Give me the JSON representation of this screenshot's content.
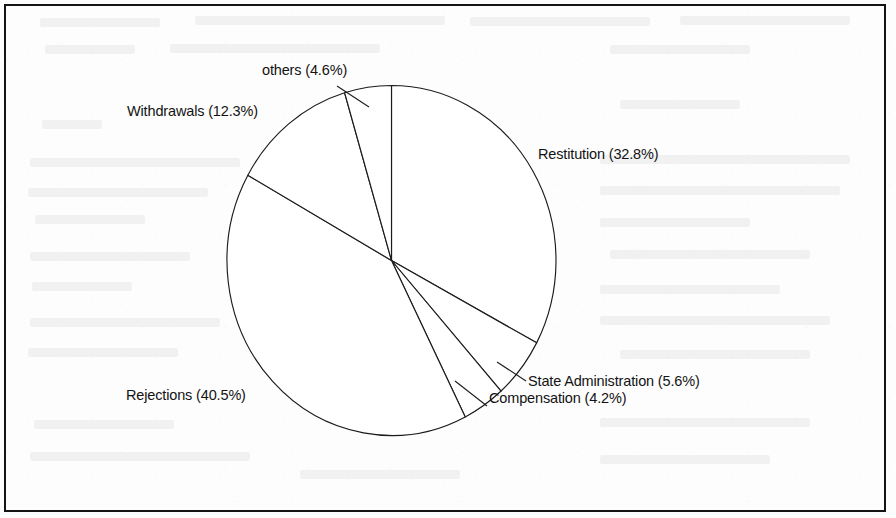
{
  "figure": {
    "kind": "pie-chart",
    "frame_border_color": "#141414",
    "background_color": "#fdfdfd",
    "ink_color": "#1b1b1b"
  },
  "chart_data": {
    "type": "pie",
    "title": "",
    "xlabel": "",
    "ylabel": "",
    "legend_position": "none",
    "labels_inline": true,
    "start_angle_deg": 0,
    "direction": "clockwise",
    "categories": [
      "Restitution",
      "State Administration",
      "Compensation",
      "Rejections",
      "Withdrawals",
      "others"
    ],
    "values": [
      32.8,
      5.6,
      4.2,
      40.5,
      12.3,
      4.6
    ],
    "units": "percent",
    "slices": [
      {
        "name": "Restitution",
        "value": 32.8,
        "label": "Restitution (32.8%)",
        "start_deg": 0.0,
        "end_deg": 118.08
      },
      {
        "name": "State Administration",
        "value": 5.6,
        "label": "State Administration (5.6%)",
        "start_deg": 118.08,
        "end_deg": 138.24
      },
      {
        "name": "Compensation",
        "value": 4.2,
        "label": "Compensation (4.2%)",
        "start_deg": 138.24,
        "end_deg": 153.36
      },
      {
        "name": "Rejections",
        "value": 40.5,
        "label": "Rejections (40.5%)",
        "start_deg": 153.36,
        "end_deg": 299.16
      },
      {
        "name": "Withdrawals",
        "value": 12.3,
        "label": "Withdrawals (12.3%)",
        "start_deg": 299.16,
        "end_deg": 343.44
      },
      {
        "name": "others",
        "value": 4.6,
        "label": "others (4.6%)",
        "start_deg": 343.44,
        "end_deg": 360.0
      }
    ]
  },
  "labels": {
    "others": "others (4.6%)",
    "withdrawals": "Withdrawals (12.3%)",
    "restitution": "Restitution (32.8%)",
    "state_administration": "State Administration (5.6%)",
    "compensation": "Compensation (4.2%)",
    "rejections": "Rejections (40.5%)"
  }
}
